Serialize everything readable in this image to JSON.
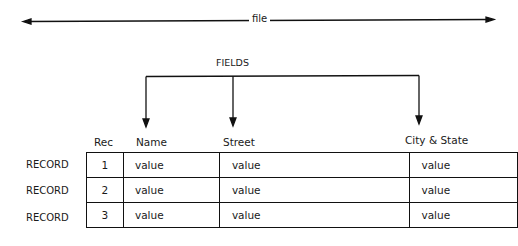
{
  "diagram": {
    "file_label": "file",
    "fields_label": "FIELDS",
    "column_headers": [
      "Rec",
      "Name",
      "Street",
      "City & State"
    ],
    "row_label": "RECORD",
    "rows": [
      {
        "label": "RECORD",
        "rec": "1",
        "name": "value",
        "street": "value",
        "city_state": "value"
      },
      {
        "label": "RECORD",
        "rec": "2",
        "name": "value",
        "street": "value",
        "city_state": "value"
      },
      {
        "label": "RECORD",
        "rec": "3",
        "name": "value",
        "street": "value",
        "city_state": "value"
      }
    ],
    "line_color": "#111111"
  }
}
